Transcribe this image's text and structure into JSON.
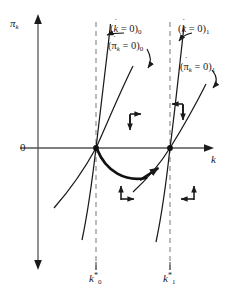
{
  "figure": {
    "type": "phase-diagram",
    "background_color": "#ffffff",
    "line_color": "#1a1a1a",
    "dashed_color": "#8a8a8a"
  },
  "axes": {
    "y_label": "π",
    "y_label_sub": "k",
    "x_label": "k",
    "origin_label": "0",
    "x_axis_y": 148,
    "y_axis_x": 38
  },
  "ticks": [
    {
      "name": "k-star-0",
      "base": "k",
      "star": "*",
      "sub": "0",
      "x": 96
    },
    {
      "name": "k-star-1",
      "base": "k",
      "star": "*",
      "sub": "1",
      "x": 170
    }
  ],
  "curve_labels": [
    {
      "id": "kdot0",
      "open": "(",
      "base": "k",
      "dot": "˙",
      "eq": " = 0",
      "close": ")",
      "sub": "0",
      "x": 110,
      "y": 24
    },
    {
      "id": "pidot0",
      "open": "(",
      "base": "π",
      "base_sub": "k",
      "dot": "˙",
      "eq": " = 0",
      "close": ")",
      "sub": "0",
      "x": 108,
      "y": 41
    },
    {
      "id": "kdot1",
      "open": "(",
      "base": "k",
      "dot": "˙",
      "eq": " = 0",
      "close": ")",
      "sub": "1",
      "x": 178,
      "y": 24
    },
    {
      "id": "pidot1",
      "open": "(",
      "base": "π",
      "base_sub": "k",
      "dot": "˙",
      "eq": " = 0",
      "close": ")",
      "sub": "1",
      "x": 180,
      "y": 62
    }
  ],
  "equilibria": [
    {
      "name": "equilibrium-0",
      "x": 96,
      "y": 148
    },
    {
      "name": "equilibrium-1",
      "x": 170,
      "y": 148
    }
  ],
  "motion_arrows": [
    {
      "name": "arrow-pair-upper-mid",
      "direction": "right-down"
    },
    {
      "name": "arrow-pair-upper-right",
      "direction": "left-down"
    },
    {
      "name": "arrow-pair-lower-mid",
      "direction": "up-right"
    },
    {
      "name": "arrow-pair-lower-right",
      "direction": "up-left"
    }
  ],
  "saddle_path": {
    "name": "saddle-path",
    "description": "Bold trajectory from k*0 dipping below axis to k*1",
    "arrow": "rightward"
  }
}
